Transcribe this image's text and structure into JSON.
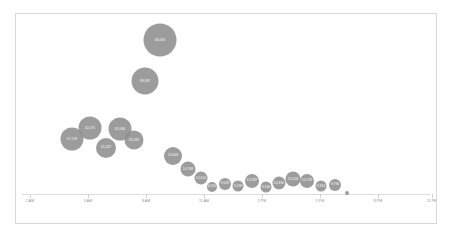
{
  "chart_data": {
    "type": "scatter",
    "title": "",
    "subtitle": "",
    "xlabel": "",
    "ylabel": "",
    "grid": false,
    "legend": "none",
    "bubble_color": "#8f8f8f",
    "label_color": "#ffffff",
    "axis_color": "#dcdcdc",
    "frame_color": "#d8d8d8",
    "background": "#ffffff",
    "xlim": [
      "2 AM",
      "11 PM"
    ],
    "x_tick_labels": [
      "2 AM",
      "5 AM",
      "8 AM",
      "11 AM",
      "2 PM",
      "5 PM",
      "8 PM",
      "11 PM"
    ],
    "x_tick_positions": [
      14,
      72,
      130,
      188,
      246,
      304,
      362,
      416
    ],
    "points": [
      {
        "label": "27,176",
        "x": 56,
        "y": 125,
        "size": 23,
        "value": 27176
      },
      {
        "label": "32,071",
        "x": 74,
        "y": 114,
        "size": 23,
        "value": 32071
      },
      {
        "label": "25,267",
        "x": 90,
        "y": 134,
        "size": 20,
        "value": 25267
      },
      {
        "label": "32,046",
        "x": 104,
        "y": 115,
        "size": 23,
        "value": 32046
      },
      {
        "label": "25,592",
        "x": 118,
        "y": 126,
        "size": 19,
        "value": 25592
      },
      {
        "label": "39,367",
        "x": 129,
        "y": 67,
        "size": 27,
        "value": 39367
      },
      {
        "label": "46,090",
        "x": 144,
        "y": 26,
        "size": 33,
        "value": 46090
      },
      {
        "label": "13,649",
        "x": 157,
        "y": 142,
        "size": 18,
        "value": 13649
      },
      {
        "label": "14,768",
        "x": 172,
        "y": 155,
        "size": 15,
        "value": 14768
      },
      {
        "label": "10,614",
        "x": 185,
        "y": 164,
        "size": 13,
        "value": 10614
      },
      {
        "label": "6,911",
        "x": 196,
        "y": 173,
        "size": 10,
        "value": 6911
      },
      {
        "label": "9,029",
        "x": 209,
        "y": 170,
        "size": 12,
        "value": 9029
      },
      {
        "label": "9,199",
        "x": 222,
        "y": 172,
        "size": 11,
        "value": 9199
      },
      {
        "label": "12,987",
        "x": 236,
        "y": 167,
        "size": 14,
        "value": 12987
      },
      {
        "label": "9,164",
        "x": 250,
        "y": 173,
        "size": 11,
        "value": 9164
      },
      {
        "label": "10,830",
        "x": 263,
        "y": 169,
        "size": 13,
        "value": 10830
      },
      {
        "label": "13,204",
        "x": 277,
        "y": 165,
        "size": 15,
        "value": 13204
      },
      {
        "label": "12,139",
        "x": 291,
        "y": 167,
        "size": 14,
        "value": 12139
      },
      {
        "label": "9,354",
        "x": 305,
        "y": 172,
        "size": 11,
        "value": 9354
      },
      {
        "label": "9,794",
        "x": 319,
        "y": 171,
        "size": 12,
        "value": 9794
      },
      {
        "label": "",
        "x": 331,
        "y": 179,
        "size": 4,
        "value": 0
      }
    ]
  }
}
